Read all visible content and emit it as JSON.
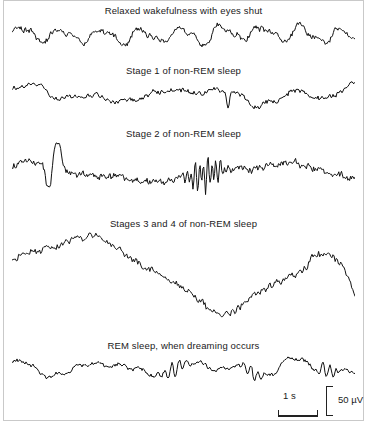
{
  "figure": {
    "background_color": "#ffffff",
    "trace_color": "#111111",
    "border_color": "#c9c9c9",
    "text_color": "#1a1a1a"
  },
  "traces": [
    {
      "id": "relaxed-wakefulness",
      "label": "Relaxed wakefulness with eyes shut",
      "label_top": 5,
      "trace_top": 18,
      "trace_left": 12,
      "trace_width": 343,
      "trace_height": 34,
      "seed": 11,
      "style": "alpha",
      "amplitude": 7.5,
      "frequency": 86,
      "noise": 2.6,
      "sample_step": 0.9
    },
    {
      "id": "stage-1-nrem",
      "label": "Stage 1 of non-REM sleep",
      "label_top": 65,
      "trace_top": 78,
      "trace_left": 12,
      "trace_width": 343,
      "trace_height": 34,
      "seed": 27,
      "style": "theta",
      "amplitude": 7,
      "frequency": 52,
      "noise": 2.2,
      "sample_step": 1.0
    },
    {
      "id": "stage-2-nrem",
      "label": "Stage 2 of non-REM sleep",
      "label_top": 128,
      "trace_top": 142,
      "trace_left": 12,
      "trace_width": 343,
      "trace_height": 62,
      "seed": 43,
      "style": "stage2",
      "amplitude": 9,
      "frequency": 40,
      "noise": 3.0,
      "sample_step": 0.9,
      "kcomplex_center": 0.12,
      "spindle_center": 0.56
    },
    {
      "id": "stages-3-4-nrem",
      "label": "Stages 3 and 4 of non-REM sleep",
      "label_top": 218,
      "trace_top": 232,
      "trace_left": 12,
      "trace_width": 343,
      "trace_height": 88,
      "seed": 61,
      "style": "delta",
      "amplitude": 30,
      "frequency": 14,
      "noise": 3.4,
      "sample_step": 1.1
    },
    {
      "id": "rem-sleep",
      "label": "REM sleep, when dreaming occurs",
      "label_top": 340,
      "trace_top": 352,
      "trace_left": 12,
      "trace_width": 343,
      "trace_height": 32,
      "seed": 79,
      "style": "rem",
      "amplitude": 5.5,
      "frequency": 64,
      "noise": 2.0,
      "sample_step": 1.0
    }
  ],
  "scalebar": {
    "time_label": "1 s",
    "voltage_label": "50 µV"
  }
}
